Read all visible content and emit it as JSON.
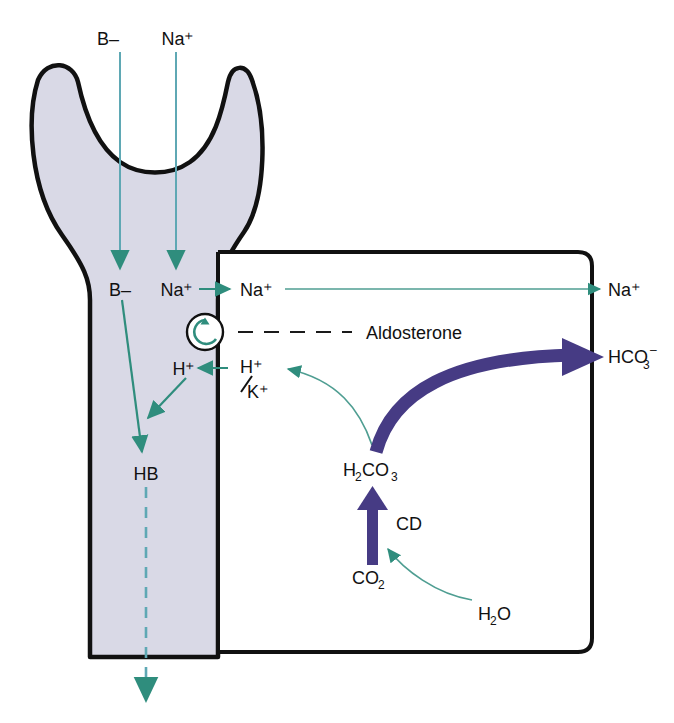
{
  "diagram": {
    "colors": {
      "teal": "#2f8d7d",
      "teal_light": "#5fa8b4",
      "purple": "#463b84",
      "lumen_fill": "#d9d9e6",
      "outline": "#111111"
    },
    "lumen_labels": {
      "b_minus_top": "B–",
      "na_plus_top": "Na⁺",
      "b_minus": "B–",
      "na_plus": "Na⁺",
      "h_plus": "H⁺",
      "hb": "HB"
    },
    "cell_labels": {
      "na_plus_in": "Na⁺",
      "aldosterone": "Aldosterone",
      "h_plus": "H⁺",
      "k_plus": "K⁺",
      "h2co3": "H",
      "h2co3_sub1": "2",
      "h2co3_mid": "CO",
      "h2co3_sub2": "3",
      "cd": "CD",
      "co2": "CO",
      "co2_sub": "2",
      "h2o": "H",
      "h2o_sub": "2",
      "h2o_end": "O"
    },
    "blood_labels": {
      "na_plus_out": "Na⁺",
      "hco3_minus": "HCO",
      "hco3_sub": "3",
      "hco3_sup": "–"
    },
    "icons": {
      "pump": "circular-pump-icon",
      "arrow_down": "arrow-down-icon",
      "arrow_right": "arrow-right-icon",
      "arrow_left": "arrow-left-icon",
      "arrow_up": "arrow-up-icon"
    }
  }
}
